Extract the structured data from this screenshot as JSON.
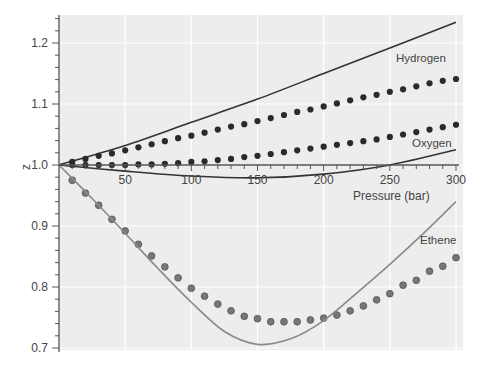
{
  "chart_data": {
    "type": "line",
    "title": "",
    "xlabel": "Pressure (bar)",
    "ylabel": "z",
    "xlim": [
      0,
      300
    ],
    "ylim": [
      0.7,
      1.25
    ],
    "x_ticks": [
      50,
      100,
      150,
      200,
      250,
      300
    ],
    "x_tick_labels": [
      "50",
      "100",
      "150",
      "200",
      "250",
      "300"
    ],
    "y_ticks": [
      0.7,
      0.8,
      0.9,
      1.0,
      1.1,
      1.2
    ],
    "y_tick_labels": [
      "0.7",
      "0.8",
      "0.9",
      "1.0",
      "1.1",
      "1.2"
    ],
    "grid": true,
    "legend": "inline labels",
    "annotations": [
      "Hydrogen",
      "Oxygen",
      "Ethene"
    ],
    "series": [
      {
        "name": "Hydrogen (ideal-model line)",
        "style": "line",
        "color": "#333333",
        "label": "Hydrogen",
        "x": [
          0,
          50,
          100,
          150,
          200,
          250,
          300
        ],
        "values": [
          1.0,
          1.032,
          1.07,
          1.108,
          1.15,
          1.192,
          1.234
        ]
      },
      {
        "name": "Hydrogen (measured)",
        "style": "dots",
        "color": "#2a2a2a",
        "x": [
          10,
          20,
          30,
          40,
          50,
          60,
          70,
          80,
          90,
          100,
          110,
          120,
          130,
          140,
          150,
          160,
          170,
          180,
          190,
          200,
          210,
          220,
          230,
          240,
          250,
          260,
          270,
          280,
          290,
          300
        ],
        "values": [
          1.005,
          1.01,
          1.015,
          1.019,
          1.024,
          1.029,
          1.034,
          1.039,
          1.044,
          1.048,
          1.053,
          1.058,
          1.063,
          1.067,
          1.072,
          1.077,
          1.082,
          1.087,
          1.091,
          1.096,
          1.101,
          1.106,
          1.111,
          1.115,
          1.12,
          1.124,
          1.129,
          1.134,
          1.138,
          1.141
        ]
      },
      {
        "name": "Oxygen (measured)",
        "style": "dots",
        "color": "#2a2a2a",
        "x": [
          10,
          20,
          30,
          40,
          50,
          60,
          70,
          80,
          90,
          100,
          110,
          120,
          130,
          140,
          150,
          160,
          170,
          180,
          190,
          200,
          210,
          220,
          230,
          240,
          250,
          260,
          270,
          280,
          290,
          300
        ],
        "values": [
          1.0,
          1.0,
          1.0,
          1.0,
          1.0,
          1.001,
          1.001,
          1.002,
          1.003,
          1.005,
          1.006,
          1.008,
          1.01,
          1.013,
          1.015,
          1.018,
          1.021,
          1.024,
          1.027,
          1.03,
          1.033,
          1.036,
          1.039,
          1.042,
          1.046,
          1.05,
          1.054,
          1.058,
          1.062,
          1.066
        ]
      },
      {
        "name": "Oxygen (model line)",
        "style": "line",
        "color": "#333333",
        "label": "Oxygen",
        "x": [
          0,
          50,
          100,
          150,
          200,
          250,
          300
        ],
        "values": [
          1.0,
          0.99,
          0.982,
          0.979,
          0.985,
          1.0,
          1.025
        ]
      },
      {
        "name": "Ethene (measured)",
        "style": "dots",
        "color": "#777777",
        "x": [
          10,
          20,
          30,
          40,
          50,
          60,
          70,
          80,
          90,
          100,
          110,
          120,
          130,
          140,
          150,
          160,
          170,
          180,
          190,
          200,
          210,
          220,
          230,
          240,
          250,
          260,
          270,
          280,
          290,
          300
        ],
        "values": [
          0.975,
          0.954,
          0.934,
          0.911,
          0.892,
          0.87,
          0.851,
          0.833,
          0.815,
          0.798,
          0.785,
          0.772,
          0.761,
          0.752,
          0.748,
          0.743,
          0.743,
          0.743,
          0.746,
          0.749,
          0.754,
          0.761,
          0.769,
          0.779,
          0.789,
          0.803,
          0.811,
          0.826,
          0.834,
          0.848
        ]
      },
      {
        "name": "Ethene (model line)",
        "style": "line",
        "color": "#8a8a8a",
        "label": "Ethene",
        "x": [
          0,
          25,
          50,
          75,
          100,
          125,
          150,
          175,
          200,
          225,
          250,
          275,
          300
        ],
        "values": [
          1.0,
          0.945,
          0.888,
          0.83,
          0.775,
          0.727,
          0.706,
          0.715,
          0.745,
          0.79,
          0.837,
          0.887,
          0.94
        ]
      }
    ]
  }
}
